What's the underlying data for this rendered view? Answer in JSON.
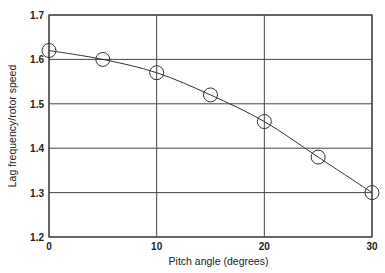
{
  "chart_data": {
    "type": "line",
    "title": "",
    "xlabel": "Pitch angle (degrees)",
    "ylabel": "Lag frequency/rotor speed",
    "x": [
      0,
      5,
      10,
      15,
      20,
      25,
      30
    ],
    "series": [
      {
        "name": "Lag frequency",
        "values": [
          1.62,
          1.6,
          1.57,
          1.52,
          1.46,
          1.38,
          1.3
        ],
        "marker": "open-circle"
      }
    ],
    "xlim": [
      0,
      30
    ],
    "ylim": [
      1.2,
      1.7
    ],
    "xticks": [
      "0",
      "10",
      "20",
      "30"
    ],
    "yticks": [
      "1.2",
      "1.3",
      "1.4",
      "1.5",
      "1.6",
      "1.7"
    ],
    "grid": true,
    "legend": "none"
  }
}
